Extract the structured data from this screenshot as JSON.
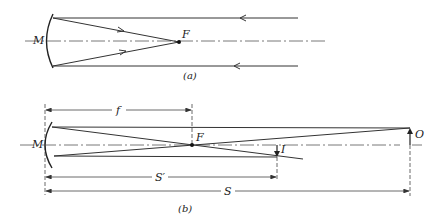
{
  "panel_a": {
    "caption": "(a)",
    "mirror_label": "M",
    "focus_label": "F",
    "description": "Parallel rays reflected by concave mirror M converge at focal point F"
  },
  "panel_b": {
    "caption": "(b)",
    "mirror_label": "M",
    "focus_label": "F",
    "object_label": "O",
    "image_label": "I",
    "focal_length_label": "f",
    "image_distance_label": "S′",
    "object_distance_label": "S",
    "description": "Object O at distance S forms inverted image I at distance S′; focal length f"
  },
  "colors": {
    "line": "#333333",
    "background": "#ffffff"
  }
}
